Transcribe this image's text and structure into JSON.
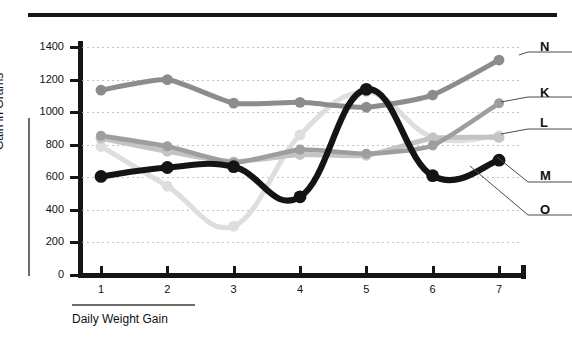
{
  "chart_data": {
    "type": "line",
    "title": "",
    "xlabel": "Daily Weight Gain",
    "ylabel": "Gain in Grams",
    "x": [
      1,
      2,
      3,
      4,
      5,
      6,
      7
    ],
    "xticklabels": [
      "1",
      "2",
      "3",
      "4",
      "5",
      "6",
      "7"
    ],
    "yticklabels": [
      "0",
      "200",
      "400",
      "600",
      "800",
      "1000",
      "1200",
      "1400"
    ],
    "ylim": [
      0,
      1400
    ],
    "ytick_step": 200,
    "grid": "horizontal-dotted",
    "legend_position": "right-outside-leader-lines",
    "series": [
      {
        "name": "N",
        "color": "#8c8c8c",
        "values": [
          1135,
          1200,
          1055,
          1060,
          1030,
          1105,
          1320
        ]
      },
      {
        "name": "K",
        "color": "#9e9e9e",
        "values": [
          855,
          790,
          690,
          770,
          745,
          795,
          1055
        ]
      },
      {
        "name": "L",
        "color": "#dedede",
        "values": [
          790,
          545,
          300,
          860,
          1125,
          845,
          855
        ]
      },
      {
        "name": "M",
        "color": "#c4c4c4",
        "values": [
          840,
          760,
          695,
          740,
          735,
          840,
          845
        ]
      },
      {
        "name": "O",
        "color": "#141414",
        "values": [
          605,
          660,
          665,
          480,
          1140,
          610,
          705
        ]
      }
    ]
  },
  "axes": {
    "y_title": "Gain in Grams",
    "x_title": "Daily Weight Gain",
    "y_ticks": [
      "1400",
      "1200",
      "1000",
      "800",
      "600",
      "400",
      "200",
      "0"
    ],
    "x_ticks": [
      "1",
      "2",
      "3",
      "4",
      "5",
      "6",
      "7"
    ]
  },
  "legend": {
    "items": [
      {
        "label": "N"
      },
      {
        "label": "K"
      },
      {
        "label": "L"
      },
      {
        "label": "M"
      },
      {
        "label": "O"
      }
    ]
  },
  "header": {
    "rule_present": "true",
    "crumb": ""
  }
}
